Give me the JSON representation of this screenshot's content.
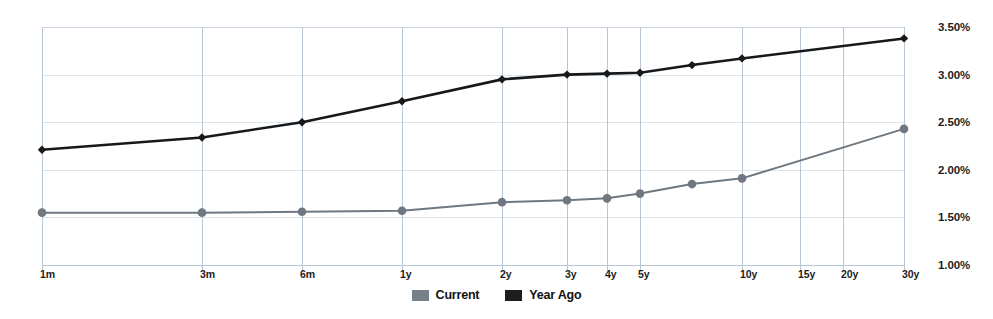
{
  "chart_data": {
    "type": "line",
    "title": "",
    "subtitle": "",
    "xlabel": "",
    "ylabel": "",
    "categories": [
      "1m",
      "3m",
      "6m",
      "1y",
      "2y",
      "3y",
      "4y",
      "5y",
      "7y",
      "10y",
      "30y"
    ],
    "x_tick_labels": [
      "1m",
      "3m",
      "6m",
      "1y",
      "2y",
      "3y",
      "4y",
      "5y",
      "10y",
      "15y",
      "20y",
      "30y"
    ],
    "y_tick_labels": [
      "3.50%",
      "3.00%",
      "2.50%",
      "2.00%",
      "1.50%",
      "1.00%"
    ],
    "y_tick_values": [
      3.5,
      3.0,
      2.5,
      2.0,
      1.5,
      1.0
    ],
    "ylim": [
      1.0,
      3.5
    ],
    "grid": true,
    "legend_position": "bottom-center",
    "series": [
      {
        "name": "Current",
        "color": "#6f7880",
        "marker": "circle",
        "values": [
          1.55,
          1.55,
          1.56,
          1.57,
          1.66,
          1.68,
          1.7,
          1.75,
          1.85,
          1.91,
          2.43
        ]
      },
      {
        "name": "Year Ago",
        "color": "#16181a",
        "marker": "diamond",
        "values": [
          2.21,
          2.34,
          2.5,
          2.72,
          2.95,
          3.0,
          3.01,
          3.02,
          3.1,
          3.17,
          3.38
        ]
      }
    ]
  },
  "legend": {
    "entries": [
      {
        "label": "Current",
        "color": "#76808a"
      },
      {
        "label": "Year Ago",
        "color": "#1b1d1f"
      }
    ]
  },
  "colors": {
    "grid_major": "#c9d6e2",
    "grid_minor": "#dbe5ee",
    "axis": "#b9c6d4",
    "current_series": "#6f7880",
    "year_ago_series": "#16181a",
    "text": "#1d1d1d",
    "background": "#ffffff"
  },
  "axis_geometry": {
    "x_positions": {
      "1m": 42,
      "3m": 202,
      "6m": 302,
      "1y": 402,
      "2y": 502,
      "3y": 567,
      "4y": 607,
      "5y": 640,
      "7y": 692,
      "10y": 742,
      "15y": 800,
      "20y": 843,
      "30y": 904
    }
  }
}
